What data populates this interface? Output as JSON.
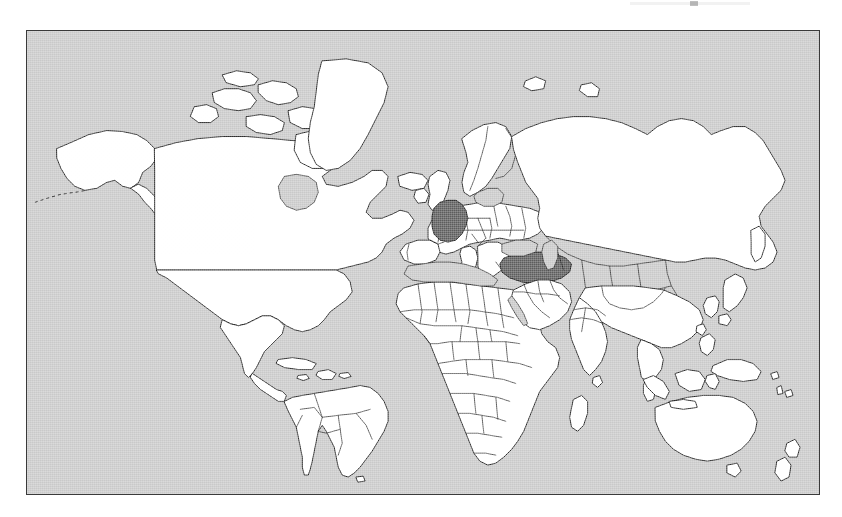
{
  "figure": {
    "kind": "world-map",
    "projection": "mercator-like rectangular world map",
    "frame": {
      "visible": true,
      "color": "#3a3a3a"
    },
    "colors": {
      "ocean": "#c9c9c9",
      "land": "#ffffff",
      "land_border": "#111111",
      "highlight": "#5d5d5d",
      "page_background": "#ffffff"
    }
  },
  "map_data": {
    "type": "choropleth",
    "title": "",
    "legend": [],
    "highlighted_countries": [
      {
        "name": "Germany",
        "continent": "Europe",
        "fill": "#5d5d5d"
      },
      {
        "name": "Turkey",
        "continent": "Europe/Asia",
        "fill": "#5d5d5d"
      }
    ],
    "unhighlighted_fill": "#ffffff",
    "regions_visible": [
      "North America",
      "South America",
      "Greenland",
      "Europe",
      "Africa",
      "Asia",
      "Australia",
      "New Zealand",
      "Indonesia",
      "Japan",
      "Madagascar",
      "Iceland",
      "British Isles"
    ],
    "inland_seas_shaded": [
      "Mediterranean Sea",
      "Black Sea",
      "Caspian Sea",
      "Baltic Sea",
      "Hudson Bay",
      "Red Sea"
    ]
  },
  "labels": {
    "map_caption": "",
    "top_note": ""
  }
}
